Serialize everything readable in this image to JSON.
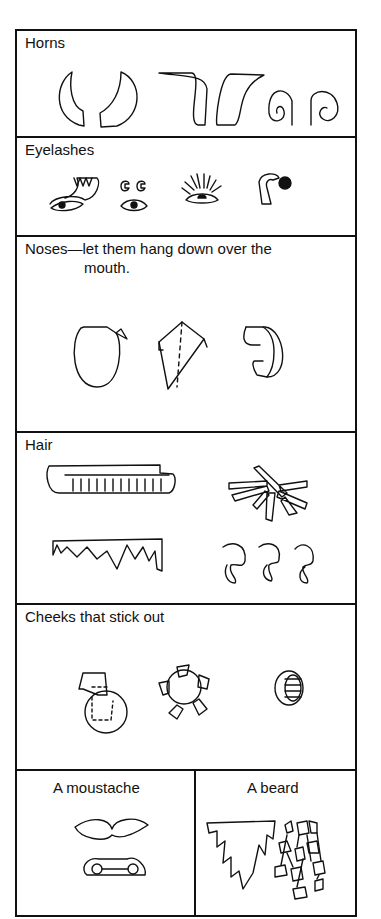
{
  "sections": {
    "horns": {
      "label": "Horns"
    },
    "eyelashes": {
      "label": "Eyelashes"
    },
    "noses": {
      "label_line1": "Noses—let them hang down over the",
      "label_line2": "mouth."
    },
    "hair": {
      "label": "Hair"
    },
    "cheeks": {
      "label": "Cheeks that stick out"
    },
    "moustache": {
      "label": "A moustache"
    },
    "beard": {
      "label": "A beard"
    }
  },
  "illustrations": {
    "horns": [
      "curved-horns",
      "flat-horns",
      "curled-horns"
    ],
    "eyelashes": [
      "fringed-lash",
      "curled-lashes",
      "radial-lashes",
      "curl-strip-eye"
    ],
    "noses": [
      "oval-nose",
      "folded-diamond-nose",
      "curled-strip-nose"
    ],
    "hair": [
      "rolled-fringe",
      "crossed-strips",
      "zigzag-fringe",
      "spiral-curls"
    ],
    "cheeks": [
      "circle-with-tab",
      "circle-with-flaps",
      "rolled-ring"
    ],
    "moustache": [
      "curved-moustache",
      "rolled-moustache"
    ],
    "beard": [
      "jagged-beard",
      "curled-strip-beard"
    ]
  }
}
